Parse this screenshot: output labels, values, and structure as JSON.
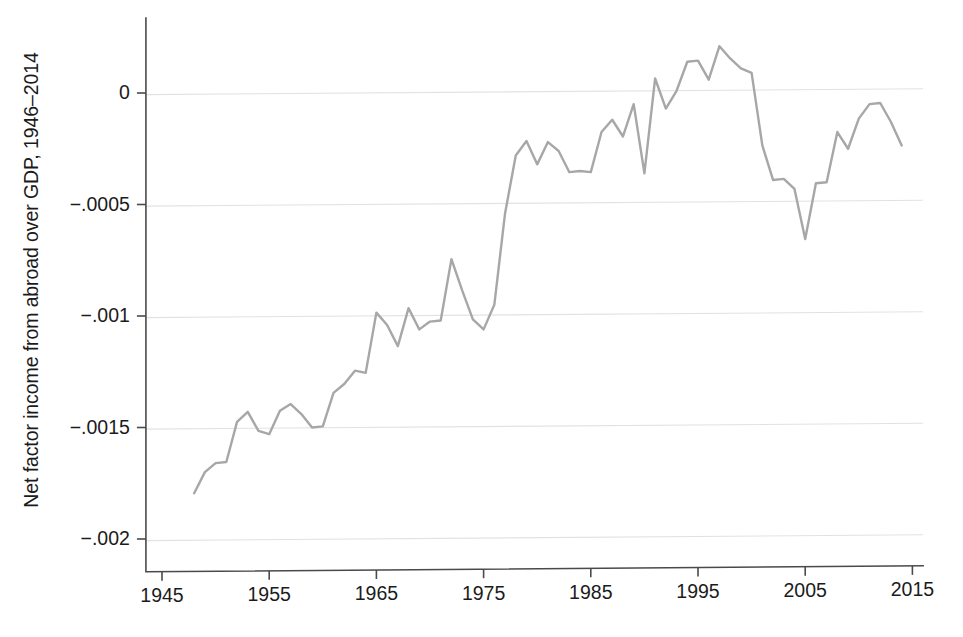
{
  "figure": {
    "width": 963,
    "height": 637,
    "background": "#ffffff",
    "line_color": "#a7a7a7",
    "grid_color": "#e2e2e2",
    "axis_color": "#4a4a4a",
    "text_color": "#1b1b1b"
  },
  "chart_data": {
    "type": "line",
    "title": "",
    "subtitle": "",
    "xlabel": "",
    "ylabel": "Net factor income from abroad over GDP, 1946–2014",
    "xlim": [
      1943.5,
      2016.0
    ],
    "ylim": [
      -0.0021,
      0.00022
    ],
    "xticks": [
      1945,
      1955,
      1965,
      1975,
      1985,
      1995,
      2005,
      2015
    ],
    "xticklabels": [
      "1945",
      "1955",
      "1965",
      "1975",
      "1985",
      "1995",
      "2005",
      "2015"
    ],
    "yticks": [
      0,
      -0.0005,
      -0.001,
      -0.0015,
      -0.002
    ],
    "yticklabels": [
      "0",
      "−.0005",
      "−.001",
      "−.0015",
      "−.002"
    ],
    "grid": "horizontal",
    "legend": "none",
    "series": [
      {
        "name": "Net factor income from abroad over GDP",
        "x": [
          1948,
          1949,
          1950,
          1951,
          1952,
          1953,
          1954,
          1955,
          1956,
          1957,
          1958,
          1959,
          1960,
          1961,
          1962,
          1963,
          1964,
          1965,
          1966,
          1967,
          1968,
          1969,
          1970,
          1971,
          1972,
          1973,
          1974,
          1975,
          1976,
          1977,
          1978,
          1979,
          1980,
          1981,
          1982,
          1983,
          1984,
          1985,
          1986,
          1987,
          1988,
          1989,
          1990,
          1991,
          1992,
          1993,
          1994,
          1995,
          1996,
          1997,
          1998,
          1999,
          2000,
          2001,
          2002,
          2003,
          2004,
          2005,
          2006,
          2007,
          2008,
          2009,
          2010,
          2011,
          2012,
          2013,
          2014
        ],
        "y": [
          -0.001795,
          -0.0017,
          -0.00166,
          -0.001655,
          -0.001475,
          -0.00143,
          -0.001515,
          -0.00153,
          -0.001425,
          -0.001395,
          -0.00144,
          -0.0015,
          -0.001495,
          -0.001345,
          -0.001305,
          -0.001245,
          -0.001255,
          -0.000985,
          -0.00104,
          -0.001135,
          -0.000965,
          -0.00106,
          -0.001025,
          -0.00102,
          -0.000745,
          -0.000885,
          -0.001015,
          -0.00106,
          -0.00095,
          -0.00054,
          -0.00028,
          -0.000215,
          -0.00032,
          -0.00022,
          -0.00026,
          -0.000355,
          -0.00035,
          -0.000355,
          -0.000175,
          -0.00012,
          -0.000195,
          -5e-05,
          -0.00036,
          6.5e-05,
          -7e-05,
          1e-05,
          0.00014,
          0.000145,
          6e-05,
          0.00021,
          0.000155,
          0.00011,
          9e-05,
          -0.000235,
          -0.00039,
          -0.000385,
          -0.00043,
          -0.000655,
          -0.000405,
          -0.0004,
          -0.000175,
          -0.00025,
          -0.000115,
          -5e-05,
          -4.5e-05,
          -0.00013,
          -0.000235
        ]
      }
    ]
  }
}
